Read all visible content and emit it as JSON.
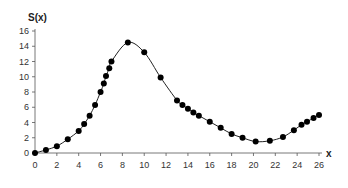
{
  "chart_data": {
    "type": "line",
    "title": "",
    "xlabel": "x",
    "ylabel": "S(x)",
    "xlim": [
      0,
      26
    ],
    "ylim": [
      0,
      16
    ],
    "xticks": [
      0,
      2,
      4,
      6,
      8,
      10,
      12,
      14,
      16,
      18,
      20,
      22,
      24,
      26
    ],
    "yticks": [
      0,
      2,
      4,
      6,
      8,
      10,
      12,
      14,
      16
    ],
    "grid": false,
    "legend": null,
    "series": [
      {
        "name": "S(x)",
        "markers": true,
        "x": [
          0,
          1,
          2,
          3,
          4,
          4.5,
          5,
          5.5,
          6,
          6.3,
          6.5,
          6.8,
          7,
          8.5,
          10,
          11.5,
          13,
          13.5,
          14,
          14.5,
          15,
          16,
          17,
          18,
          19,
          20.2,
          21.5,
          22.7,
          23.7,
          24.4,
          24.9,
          25.5,
          26
        ],
        "y": [
          0,
          0.4,
          0.9,
          1.8,
          2.9,
          3.8,
          4.9,
          6.3,
          8.0,
          9.1,
          10.1,
          11.1,
          12.0,
          14.5,
          13.2,
          9.9,
          6.9,
          6.3,
          5.8,
          5.3,
          4.9,
          4.1,
          3.3,
          2.5,
          2.0,
          1.5,
          1.6,
          2.1,
          3.0,
          3.7,
          4.1,
          4.6,
          5.0
        ]
      }
    ]
  }
}
